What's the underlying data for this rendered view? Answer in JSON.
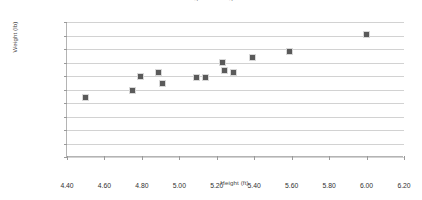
{
  "chart_data": {
    "type": "scatter",
    "title": "Height vs Weight",
    "xlabel": "Height (ft)",
    "ylabel": "Weight (lb)",
    "xlim": [
      4.4,
      6.2
    ],
    "ylim": [
      0,
      200
    ],
    "grid": true,
    "legend": false,
    "marker_color": "#5a5a5a",
    "marker_shape": "square",
    "xticks": [
      "4.40",
      "4.60",
      "4.80",
      "5.00",
      "5.20",
      "5.40",
      "5.60",
      "5.80",
      "6.00",
      "6.20"
    ],
    "xtick_values": [
      4.4,
      4.6,
      4.8,
      5.0,
      5.2,
      5.4,
      5.6,
      5.8,
      6.0,
      6.2
    ],
    "yticks": [
      "0",
      "20",
      "40",
      "60",
      "80",
      "100",
      "120",
      "140",
      "160",
      "180",
      "200"
    ],
    "ytick_values": [
      0,
      20,
      40,
      60,
      80,
      100,
      120,
      140,
      160,
      180,
      200
    ],
    "points": [
      {
        "x": 4.5,
        "y": 88
      },
      {
        "x": 4.75,
        "y": 99
      },
      {
        "x": 4.79,
        "y": 120
      },
      {
        "x": 4.89,
        "y": 125
      },
      {
        "x": 4.91,
        "y": 109
      },
      {
        "x": 5.09,
        "y": 118
      },
      {
        "x": 5.14,
        "y": 118
      },
      {
        "x": 5.23,
        "y": 140
      },
      {
        "x": 5.24,
        "y": 128
      },
      {
        "x": 5.29,
        "y": 125
      },
      {
        "x": 5.39,
        "y": 147
      },
      {
        "x": 5.59,
        "y": 156
      },
      {
        "x": 6.0,
        "y": 182
      }
    ]
  }
}
